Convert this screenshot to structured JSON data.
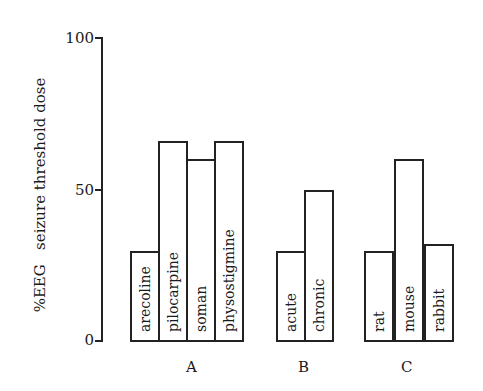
{
  "chart_data": {
    "type": "bar",
    "title": "",
    "xlabel": "",
    "ylabel": "%EEG   seizure threshold dose",
    "ylim": [
      0,
      100
    ],
    "yticks": [
      0,
      50,
      100
    ],
    "grid": false,
    "legend": null,
    "groups": [
      {
        "name": "A",
        "categories": [
          "arecoline",
          "pilocarpine",
          "soman",
          "physostigmine"
        ],
        "values": [
          30,
          66,
          60,
          66
        ]
      },
      {
        "name": "B",
        "categories": [
          "acute",
          "chronic"
        ],
        "values": [
          30,
          50
        ]
      },
      {
        "name": "C",
        "categories": [
          "rat",
          "mouse",
          "rabbit"
        ],
        "values": [
          30,
          60,
          32
        ]
      }
    ],
    "categories": [
      "arecoline",
      "pilocarpine",
      "soman",
      "physostigmine",
      "acute",
      "chronic",
      "rat",
      "mouse",
      "rabbit"
    ],
    "values": [
      30,
      66,
      60,
      66,
      30,
      50,
      30,
      60,
      32
    ]
  },
  "labels": {
    "ylabel": "%EEG   seizure threshold dose",
    "ytick_0": "0",
    "ytick_50": "50",
    "ytick_100": "100",
    "group_A": "A",
    "group_B": "B",
    "group_C": "C"
  }
}
